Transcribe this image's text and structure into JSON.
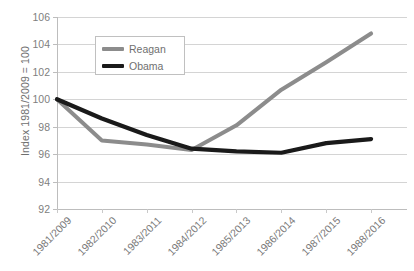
{
  "chart_data": {
    "type": "line",
    "title": "",
    "xlabel": "",
    "ylabel": "Index 1981/2009 = 100",
    "categories": [
      "1981/2009",
      "1982/2010",
      "1983/2011",
      "1984/2012",
      "1985/2013",
      "1986/2014",
      "1987/2015",
      "1988/2016"
    ],
    "ylim": [
      92,
      106
    ],
    "ytick_values": [
      92,
      94,
      96,
      98,
      100,
      102,
      104,
      106
    ],
    "ytick_labels": [
      "92",
      "94",
      "96",
      "98",
      "100",
      "102",
      "104",
      "106"
    ],
    "grid": true,
    "legend_position": "upper-left-inside",
    "series": [
      {
        "name": "Reagan",
        "color": "#8c8c8c",
        "values": [
          100.0,
          97.0,
          96.7,
          96.3,
          98.1,
          100.7,
          102.7,
          104.8
        ]
      },
      {
        "name": "Obama",
        "color": "#1a1a1a",
        "values": [
          100.0,
          98.6,
          97.4,
          96.4,
          96.2,
          96.1,
          96.8,
          97.1
        ]
      }
    ]
  },
  "legend": {
    "entries": [
      {
        "label": "Reagan",
        "color": "#8c8c8c"
      },
      {
        "label": "Obama",
        "color": "#1a1a1a"
      }
    ]
  },
  "axes": {
    "y_title": "Index 1981/2009 = 100"
  },
  "footer": {
    "cut_text": ""
  }
}
